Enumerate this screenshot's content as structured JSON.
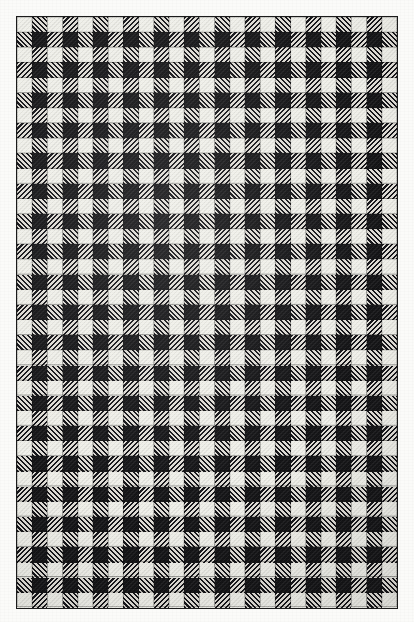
{
  "image": {
    "kind": "textile-swatch-scan",
    "subject": "black and white gingham check fabric",
    "alt_text": "Scanned black-and-white gingham check fabric swatch",
    "caption": "",
    "background_color": "#fbfbf9"
  },
  "frame": {
    "border_color": "#1b1b1b",
    "border_width_px": 1.5,
    "left_px": 16,
    "top_px": 16,
    "width_px": 382,
    "height_px": 593
  },
  "pattern": {
    "name": "gingham-check",
    "columns": 25,
    "rows": 39,
    "cell_pitch_px": 15.2,
    "tones": [
      "light",
      "hatch",
      "dark"
    ],
    "colors": {
      "light": "#efefe9",
      "hatch_light_thread": "#dedbd4",
      "hatch_dark_thread": "#16161a",
      "dark": "#141416",
      "motif": "#e8e6df"
    },
    "hatch_angle_deg": 135,
    "hatch_alt_angle_deg": 45,
    "motif": {
      "name": "x-cross-eyelet",
      "description": "small woven X motif on scattered dark squares",
      "period_columns": 6,
      "period_rows": 6,
      "offset_columns": 3,
      "offset_rows": 2
    }
  }
}
